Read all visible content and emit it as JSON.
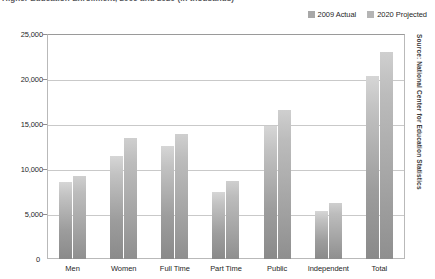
{
  "title_clipped": "Higher Education Enrollment, 2009 and 2020 (in thousands)",
  "legend": {
    "position": "top-right",
    "items": [
      {
        "label": "2009 Actual",
        "color": "#a8a8a8"
      },
      {
        "label": "2020 Projected",
        "color": "#b5b5b5"
      }
    ]
  },
  "source_note": "Source: National Center for Education Statistics",
  "axis": {
    "y_ticks": [
      "25,000",
      "20,000",
      "15,000",
      "10,000",
      "5,000"
    ],
    "zero_label": "0"
  },
  "chart_data": {
    "type": "bar",
    "title": "Higher Education Enrollment, 2009 and 2020 (in thousands)",
    "xlabel": "",
    "ylabel": "",
    "ylim": [
      0,
      25000
    ],
    "yticks": [
      0,
      5000,
      10000,
      15000,
      20000,
      25000
    ],
    "ytick_labels": [
      "0",
      "5,000",
      "10,000",
      "15,000",
      "20,000",
      "25,000"
    ],
    "grid": true,
    "legend_position": "top-right",
    "categories": [
      "Men",
      "Women",
      "Full Time",
      "Part Time",
      "Public",
      "Independent",
      "Total"
    ],
    "series": [
      {
        "name": "2009 Actual",
        "color": "#a8a8a8",
        "values": [
          8600,
          11500,
          12600,
          7500,
          14800,
          5300,
          20300
        ]
      },
      {
        "name": "2020 Projected",
        "color": "#b5b5b5",
        "values": [
          9200,
          13400,
          13900,
          8700,
          16600,
          6200,
          23000
        ]
      }
    ]
  }
}
